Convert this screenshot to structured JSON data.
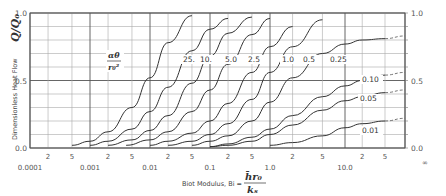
{
  "chart_data": {
    "type": "line",
    "title": "",
    "xlabel": "Biot Modulus, Bi = h̄r₀/kₛ",
    "xlabel_prefix": "Biot Modulus, Bi =",
    "xlabel_num": "h̄r₀",
    "xlabel_den": "kₛ",
    "ylabel": "Dimensionless Heat Flow",
    "ylabel_symbol": "Q/Q₀",
    "x_scale": "log",
    "xlim": [
      0.0001,
      "∞"
    ],
    "ylim": [
      0.0,
      1.0
    ],
    "grid": true,
    "x_major_ticks": [
      "0.0001",
      "0.001",
      "0.01",
      "0.1",
      "1.0",
      "10.0",
      "∞"
    ],
    "x_minor_ticks": [
      "2",
      "5",
      "2",
      "5",
      "2",
      "5",
      "2",
      "5",
      "2",
      "5",
      "2",
      "5"
    ],
    "y_ticks_left": [
      "1.0",
      "0.5",
      "0.0"
    ],
    "y_ticks_right": [
      "1.0",
      "0.5",
      "0.0"
    ],
    "parameter_label": "αθ/r₀²",
    "parameter_num": "αθ",
    "parameter_den": "r₀²",
    "series": [
      {
        "name": "25.",
        "x": [
          0.0005,
          0.001,
          0.002,
          0.005,
          0.01,
          0.02,
          0.05
        ],
        "y": [
          0.02,
          0.05,
          0.12,
          0.3,
          0.52,
          0.78,
          0.98
        ]
      },
      {
        "name": "10.",
        "x": [
          0.001,
          0.002,
          0.005,
          0.01,
          0.02,
          0.05,
          0.1,
          0.2
        ],
        "y": [
          0.02,
          0.05,
          0.14,
          0.27,
          0.45,
          0.72,
          0.88,
          0.96
        ]
      },
      {
        "name": "5.0",
        "x": [
          0.002,
          0.005,
          0.01,
          0.02,
          0.05,
          0.1,
          0.2,
          0.5
        ],
        "y": [
          0.02,
          0.06,
          0.13,
          0.24,
          0.48,
          0.68,
          0.85,
          0.97
        ]
      },
      {
        "name": "2.5",
        "x": [
          0.004,
          0.01,
          0.02,
          0.05,
          0.1,
          0.2,
          0.5,
          1.0
        ],
        "y": [
          0.02,
          0.06,
          0.12,
          0.27,
          0.43,
          0.62,
          0.84,
          0.96
        ]
      },
      {
        "name": "1.0",
        "x": [
          0.01,
          0.02,
          0.05,
          0.1,
          0.2,
          0.5,
          1.0,
          2.0
        ],
        "y": [
          0.02,
          0.05,
          0.11,
          0.2,
          0.33,
          0.56,
          0.75,
          0.9
        ]
      },
      {
        "name": "0.5",
        "x": [
          0.02,
          0.05,
          0.1,
          0.2,
          0.5,
          1.0,
          2.0,
          5.0
        ],
        "y": [
          0.02,
          0.05,
          0.1,
          0.18,
          0.36,
          0.56,
          0.75,
          0.95
        ]
      },
      {
        "name": "0.25",
        "x": [
          0.05,
          0.1,
          0.2,
          0.5,
          1.0,
          2.0,
          5.0,
          10.0,
          20.0,
          50.0,
          "∞"
        ],
        "y": [
          0.02,
          0.05,
          0.09,
          0.2,
          0.34,
          0.52,
          0.7,
          0.77,
          0.8,
          0.81,
          0.83
        ]
      },
      {
        "name": "0.10",
        "x": [
          0.1,
          0.2,
          0.5,
          1.0,
          2.0,
          5.0,
          10.0,
          20.0,
          50.0,
          "∞"
        ],
        "y": [
          0.01,
          0.03,
          0.08,
          0.14,
          0.24,
          0.38,
          0.46,
          0.5,
          0.54,
          0.56
        ]
      },
      {
        "name": "0.05",
        "x": [
          0.1,
          0.2,
          0.5,
          1.0,
          2.0,
          5.0,
          10.0,
          20.0,
          50.0,
          "∞"
        ],
        "y": [
          0.01,
          0.02,
          0.05,
          0.1,
          0.17,
          0.28,
          0.35,
          0.38,
          0.41,
          0.43
        ]
      },
      {
        "name": "0.01",
        "x": [
          1.0,
          2.0,
          5.0,
          10.0,
          20.0,
          50.0,
          "∞"
        ],
        "y": [
          0.02,
          0.04,
          0.09,
          0.15,
          0.18,
          0.2,
          0.22
        ]
      }
    ],
    "dashed_extrapolation_beyond_x": 50,
    "legend_position": "inline curve labels"
  }
}
